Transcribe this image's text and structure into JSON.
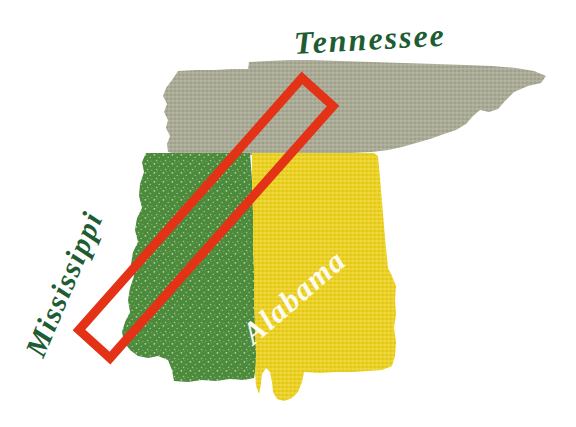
{
  "figure": {
    "kind": "thematic-state-map",
    "width": 576,
    "height": 427,
    "background_color": "#ffffff"
  },
  "states": [
    {
      "id": "tennessee",
      "label": "Tennessee",
      "fill_color": "#a9aa95",
      "label_color": "#1e5c34",
      "label_rotation_deg": -3.2,
      "texture": "speckled-halftone"
    },
    {
      "id": "mississippi",
      "label": "Mississippi",
      "fill_color": "#4d8b3c",
      "label_color": "#1e5c34",
      "label_rotation_deg": -67,
      "texture": "speckled-halftone"
    },
    {
      "id": "alabama",
      "label": "Alabama",
      "fill_color": "#ead021",
      "label_color": "#fdfbf0",
      "label_rotation_deg": -41,
      "texture": "speckled-halftone"
    }
  ],
  "annotation": {
    "id": "study-area-box",
    "shape": "rotated-rectangle",
    "stroke_color": "#e33216",
    "stroke_width": 9,
    "fill": "none",
    "corners": [
      {
        "x": 302,
        "y": 78
      },
      {
        "x": 333,
        "y": 106
      },
      {
        "x": 110,
        "y": 358
      },
      {
        "x": 79,
        "y": 330
      }
    ]
  },
  "colors": {
    "tennessee_gray_green": "#a9aa95",
    "mississippi_green": "#4d8b3c",
    "alabama_yellow": "#ead021",
    "label_dark_green": "#1e5c34",
    "annotation_red": "#e33216",
    "background_white": "#ffffff"
  }
}
